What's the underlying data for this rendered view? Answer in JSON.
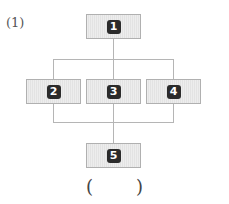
{
  "problem_label": "(1)",
  "nodes": [
    {
      "id": "1",
      "label": "1"
    },
    {
      "id": "2",
      "label": "2"
    },
    {
      "id": "3",
      "label": "3"
    },
    {
      "id": "4",
      "label": "4"
    },
    {
      "id": "5",
      "label": "5"
    }
  ],
  "edges": [
    [
      "1",
      "2"
    ],
    [
      "1",
      "3"
    ],
    [
      "1",
      "4"
    ],
    [
      "2",
      "5"
    ],
    [
      "3",
      "5"
    ],
    [
      "4",
      "5"
    ]
  ],
  "answer_blank": {
    "open": "(",
    "close": ")"
  },
  "colors": {
    "box_fill": "#e3e3e3",
    "box_border": "#b0b0b0",
    "badge": "#2b2b2b",
    "line": "#b5b5b5"
  }
}
